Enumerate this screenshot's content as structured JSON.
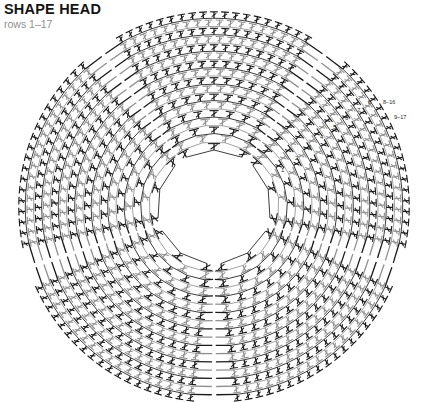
{
  "header": {
    "title": "SHAPE HEAD",
    "subtitle": "rows 1–17"
  },
  "colors": {
    "dark_stitch": "#1a1a1a",
    "light_stitch": "#909090",
    "title": "#141414",
    "subtitle": "#8f8f8f",
    "background": "#ffffff"
  },
  "chart_data": {
    "type": "diagram",
    "diagram_kind": "crochet-stitch-chart-radial",
    "title": "SHAPE HEAD",
    "subtitle": "rows 1–17",
    "center": [
      214,
      207
    ],
    "outer_radius": 196,
    "inner_radius": 56,
    "row_count": 17,
    "row_numbers": [
      1,
      2,
      3,
      4,
      5,
      6,
      7,
      8,
      9,
      10,
      11,
      12,
      13,
      14,
      15,
      16,
      17
    ],
    "row_label_positions": [
      {
        "label": "1",
        "x": 281,
        "y": 172
      },
      {
        "label": "2",
        "x": 295,
        "y": 160
      },
      {
        "label": "3",
        "x": 308,
        "y": 149
      },
      {
        "label": "4",
        "x": 320,
        "y": 139
      },
      {
        "label": "5",
        "x": 333,
        "y": 129
      },
      {
        "label": "6",
        "x": 345,
        "y": 120
      },
      {
        "label": "7",
        "x": 357,
        "y": 112
      },
      {
        "label": "8",
        "x": 368,
        "y": 104
      }
    ],
    "range_labels": [
      {
        "label": "8–16",
        "x": 383,
        "y": 104
      },
      {
        "label": "9–17",
        "x": 394,
        "y": 119
      }
    ],
    "stitch_legend": [
      {
        "symbol": "double-crochet",
        "glyph": "T-bar with slash"
      },
      {
        "symbol": "chain",
        "glyph": "small oval"
      },
      {
        "symbol": "slip-stitch",
        "glyph": "dot"
      }
    ],
    "segments": 5,
    "segment_gap_degrees": 14
  }
}
